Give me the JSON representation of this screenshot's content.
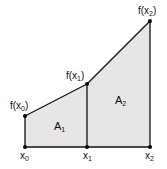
{
  "diagram": {
    "colors": {
      "fill": "#e6e6e6",
      "stroke": "#111111",
      "background": "#ffffff"
    },
    "points": {
      "x0": {
        "label": "x",
        "sub": "0"
      },
      "x1": {
        "label": "x",
        "sub": "1"
      },
      "x2": {
        "label": "x",
        "sub": "2"
      },
      "fx0": {
        "label": "f(x",
        "sub": "0",
        "close": ")"
      },
      "fx1": {
        "label": "f(x",
        "sub": "1",
        "close": ")"
      },
      "fx2": {
        "label": "f(x",
        "sub": "2",
        "close": ")"
      }
    },
    "areas": {
      "A1": {
        "label": "A",
        "sub": "1"
      },
      "A2": {
        "label": "A",
        "sub": "2"
      }
    }
  }
}
